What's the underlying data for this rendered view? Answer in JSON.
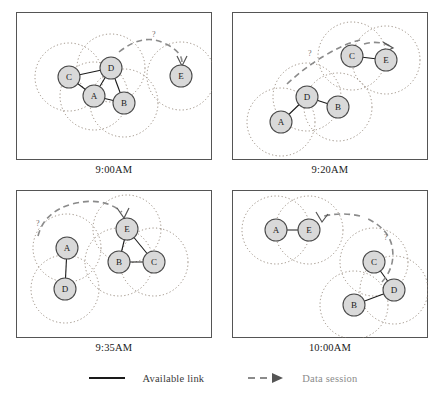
{
  "figure": {
    "type": "network-topology-timeline"
  },
  "style": {
    "node_fill": "#d9d9d9",
    "node_stroke": "#4a4a4a",
    "link_color": "#1a1a1a",
    "coverage_color": "#8d7f72",
    "session_color": "#8b8b8b",
    "panel_border": "#555555",
    "node_radius": 11,
    "coverage_radius": 34
  },
  "panels": [
    {
      "id": "panel-9-00am",
      "caption": "9:00AM",
      "nodes": [
        {
          "id": "C",
          "label": "C",
          "x": 53,
          "y": 65
        },
        {
          "id": "D",
          "label": "D",
          "x": 95,
          "y": 56
        },
        {
          "id": "A",
          "label": "A",
          "x": 78,
          "y": 84
        },
        {
          "id": "B",
          "label": "B",
          "x": 108,
          "y": 91
        },
        {
          "id": "E",
          "label": "E",
          "x": 165,
          "y": 64
        }
      ],
      "links": [
        {
          "from": "C",
          "to": "D"
        },
        {
          "from": "C",
          "to": "A"
        },
        {
          "from": "A",
          "to": "D"
        },
        {
          "from": "D",
          "to": "B"
        },
        {
          "from": "A",
          "to": "B"
        }
      ],
      "session": {
        "from": "D",
        "to": "E",
        "label": "?"
      }
    },
    {
      "id": "panel-9-20am",
      "caption": "9:20AM",
      "nodes": [
        {
          "id": "C",
          "label": "C",
          "x": 120,
          "y": 44
        },
        {
          "id": "E",
          "label": "E",
          "x": 154,
          "y": 48
        },
        {
          "id": "D",
          "label": "D",
          "x": 75,
          "y": 85
        },
        {
          "id": "B",
          "label": "B",
          "x": 106,
          "y": 95
        },
        {
          "id": "A",
          "label": "A",
          "x": 49,
          "y": 110
        }
      ],
      "links": [
        {
          "from": "C",
          "to": "E"
        },
        {
          "from": "A",
          "to": "D"
        },
        {
          "from": "D",
          "to": "B"
        }
      ],
      "session": {
        "from": "D",
        "to": "E",
        "label": "?"
      }
    },
    {
      "id": "panel-9-35am",
      "caption": "9:35AM",
      "nodes": [
        {
          "id": "A",
          "label": "A",
          "x": 51,
          "y": 58
        },
        {
          "id": "D",
          "label": "D",
          "x": 49,
          "y": 99
        },
        {
          "id": "E",
          "label": "E",
          "x": 111,
          "y": 39
        },
        {
          "id": "B",
          "label": "B",
          "x": 103,
          "y": 72
        },
        {
          "id": "C",
          "label": "C",
          "x": 138,
          "y": 72
        }
      ],
      "links": [
        {
          "from": "A",
          "to": "D"
        },
        {
          "from": "E",
          "to": "B"
        },
        {
          "from": "E",
          "to": "C"
        },
        {
          "from": "B",
          "to": "C"
        }
      ],
      "session": {
        "from": "D",
        "to": "E",
        "label": "?"
      }
    },
    {
      "id": "panel-10-00am",
      "caption": "10:00AM",
      "nodes": [
        {
          "id": "A",
          "label": "A",
          "x": 44,
          "y": 40
        },
        {
          "id": "E",
          "label": "E",
          "x": 77,
          "y": 40
        },
        {
          "id": "C",
          "label": "C",
          "x": 142,
          "y": 72
        },
        {
          "id": "D",
          "label": "D",
          "x": 162,
          "y": 100
        },
        {
          "id": "B",
          "label": "B",
          "x": 122,
          "y": 115
        }
      ],
      "links": [
        {
          "from": "A",
          "to": "E"
        },
        {
          "from": "C",
          "to": "D"
        },
        {
          "from": "B",
          "to": "D"
        }
      ],
      "session": {
        "from": "C",
        "to": "E",
        "label": "?"
      }
    }
  ],
  "legend": {
    "items": [
      {
        "id": "available-link",
        "label": "Available link",
        "style": "solid"
      },
      {
        "id": "data-session",
        "label": "Data session",
        "style": "dashed-arrow"
      }
    ]
  }
}
